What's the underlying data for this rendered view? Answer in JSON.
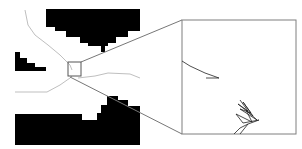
{
  "figure": {
    "width": 302,
    "height": 149,
    "background": "#ffffff",
    "obstacle_color": "#000000",
    "path_color": "#bfbfbf",
    "frame_color": "#7f7f7f",
    "detail_path_color": "#222222"
  },
  "obstacles": [
    {
      "name": "top-block",
      "points": "46,9 140,9 140,31 128,31 128,37 116,37 116,43 108,43 108,46 105,46 105,52 101,52 101,46 88,46 88,43 80,43 80,37 66,37 66,31 55,31 55,27 46,27"
    },
    {
      "name": "left-steps",
      "points": "15,52 20,52 20,58 27,58 27,63 35,63 35,67 46,67 46,71 15,71"
    },
    {
      "name": "bottom-block",
      "points": "15,114 82,114 82,120 97,120 97,113 101,113 101,105 107,105 107,96 118,96 118,100 128,100 128,106 140,106 140,145 15,145"
    }
  ],
  "paths": [
    {
      "name": "trajectory-upper",
      "points": "25,10 28,25 35,35 48,45 60,55 70,65 72,70"
    },
    {
      "name": "trajectory-lower-left",
      "points": "15,92 47,92 60,85 70,78 72,76"
    },
    {
      "name": "trajectory-right",
      "points": "78,78 95,76 108,73 130,74 140,78"
    }
  ],
  "selection_box": {
    "x": 68,
    "y": 62,
    "w": 13,
    "h": 14
  },
  "inset": {
    "x": 182,
    "y": 20,
    "w": 114,
    "h": 114
  },
  "connectors": [
    {
      "from": "81,62",
      "to": "182,20"
    },
    {
      "from": "70,77",
      "to": "182,134"
    }
  ],
  "inset_paths": [
    {
      "name": "detail-curve-top",
      "points": "182,61 190,66 205,73 219,78 206,78"
    },
    {
      "name": "detail-scribble",
      "points": "240,100 248,111 238,104 253,116 243,102 251,113 240,109 257,120 246,110 252,122 236,114 243,123 259,120 248,124 240,134"
    },
    {
      "name": "detail-curve-bottom",
      "points": "234,134 240,128 248,124"
    }
  ]
}
